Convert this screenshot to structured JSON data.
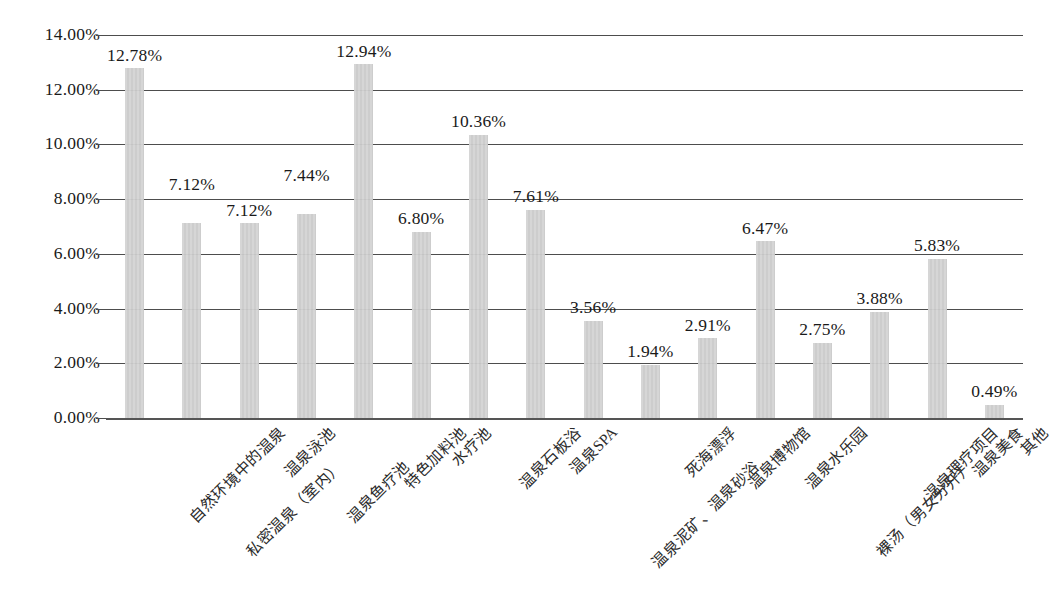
{
  "chart_data": {
    "type": "bar",
    "title": "",
    "subtitle": "",
    "xlabel": "",
    "ylabel": "",
    "ylim": [
      0,
      14
    ],
    "ytick_values": [
      14,
      12,
      10,
      8,
      6,
      4,
      2,
      0
    ],
    "ytick_labels": [
      "14.00%",
      "12.00%",
      "10.00%",
      "8.00%",
      "6.00%",
      "4.00%",
      "2.00%",
      "0.00%"
    ],
    "grid": true,
    "legend": "none",
    "value_format": "percent",
    "bar_color": "#d0d0d0",
    "axis_color": "#4d4d4d",
    "categories": [
      "自然环境中的温泉",
      "私密温泉（室内）",
      "温泉泳池",
      "温泉鱼疗池",
      "特色加料池",
      "水疗池",
      "温泉石板浴",
      "温泉SPA",
      "温泉泥矿、温泉砂浴",
      "死海漂浮",
      "温泉博物馆",
      "温泉水乐园",
      "裸汤（男女分开）",
      "温泉理疗项目",
      "温泉美食",
      "其他"
    ],
    "values": [
      12.78,
      7.12,
      7.12,
      7.44,
      12.94,
      6.8,
      10.36,
      7.61,
      3.56,
      1.94,
      2.91,
      6.47,
      2.75,
      3.88,
      5.83,
      0.49
    ],
    "data_labels": [
      "12.78%",
      "7.12%",
      "7.12%",
      "7.44%",
      "12.94%",
      "6.80%",
      "10.36%",
      "7.61%",
      "3.56%",
      "1.94%",
      "2.91%",
      "6.47%",
      "2.75%",
      "3.88%",
      "5.83%",
      "0.49%"
    ],
    "label_raised": [
      false,
      true,
      false,
      true,
      false,
      false,
      false,
      false,
      false,
      false,
      false,
      false,
      false,
      false,
      false,
      false
    ],
    "category_label_staggered": [
      false,
      true,
      false,
      true,
      false,
      false,
      false,
      false,
      true,
      false,
      false,
      false,
      true,
      false,
      false,
      false
    ]
  }
}
